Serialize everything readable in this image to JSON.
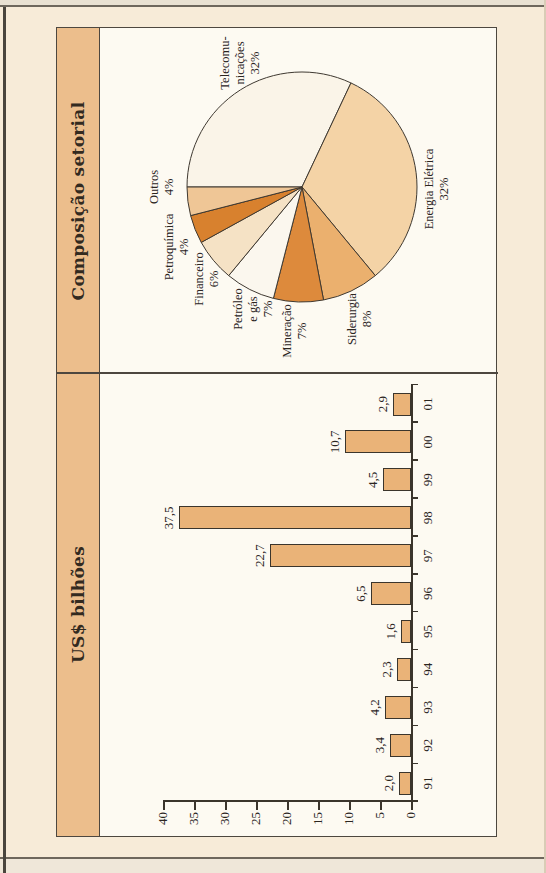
{
  "figure": {
    "panels": [
      {
        "title": "US$ bilhões"
      },
      {
        "title": "Composição setorial"
      }
    ]
  },
  "chart_data": [
    {
      "type": "bar",
      "title": "US$ bilhões",
      "categories": [
        "91",
        "92",
        "93",
        "94",
        "95",
        "96",
        "97",
        "98",
        "99",
        "00",
        "01"
      ],
      "values": [
        2.0,
        3.4,
        4.2,
        2.3,
        1.6,
        6.5,
        22.7,
        37.5,
        4.5,
        10.7,
        2.9
      ],
      "value_labels": [
        "2,0",
        "3,4",
        "4,2",
        "2,3",
        "1,6",
        "6,5",
        "22,7",
        "37,5",
        "4,5",
        "10,7",
        "2,9"
      ],
      "ylim": [
        0,
        40
      ],
      "ytick_step": 5,
      "yticks": [
        "0",
        "5",
        "10",
        "15",
        "20",
        "25",
        "30",
        "35",
        "40"
      ],
      "grid": false,
      "bar_color": "#eab378",
      "axis_color": "#3b352c",
      "orientation_note": "whole plate printed rotated 90° CCW on page"
    },
    {
      "type": "pie",
      "title": "Composição setorial",
      "start_angle_deg": -90,
      "direction": "clockwise",
      "slices": [
        {
          "name": "Telecomunicações",
          "value": 32,
          "lines": [
            "Telecomu-",
            "nicações",
            "32%"
          ],
          "color": "#faf4e8",
          "label_at": [
            310,
            139
          ]
        },
        {
          "name": "Energia Elétrica",
          "value": 32,
          "lines": [
            "Energia Elétrica",
            "32%"
          ],
          "color": "#f4d3a6",
          "label_at": [
            184,
            336
          ]
        },
        {
          "name": "Siderurgia",
          "value": 8,
          "lines": [
            "Siderurgia",
            "8%"
          ],
          "color": "#ebb06e",
          "label_at": [
            54,
            259
          ]
        },
        {
          "name": "Mineração",
          "value": 7,
          "lines": [
            "Mineração",
            "7%"
          ],
          "color": "#dd8a3c",
          "label_at": [
            42,
            194
          ]
        },
        {
          "name": "Petróleo e gás",
          "value": 7,
          "lines": [
            "Petróleo",
            "e gás",
            "7%"
          ],
          "color": "#fbf7ee",
          "label_at": [
            64,
            152
          ]
        },
        {
          "name": "Financeiro",
          "value": 6,
          "lines": [
            "Financeiro",
            "6%"
          ],
          "color": "#f5e2c5",
          "label_at": [
            94,
            106
          ]
        },
        {
          "name": "Petroquímica",
          "value": 4,
          "lines": [
            "Petroquímica",
            "4%"
          ],
          "color": "#d8812e",
          "label_at": [
            126,
            76
          ]
        },
        {
          "name": "Outros",
          "value": 4,
          "lines": [
            "Outros",
            "4%"
          ],
          "color": "#efc696",
          "label_at": [
            186,
            61
          ]
        }
      ]
    }
  ]
}
